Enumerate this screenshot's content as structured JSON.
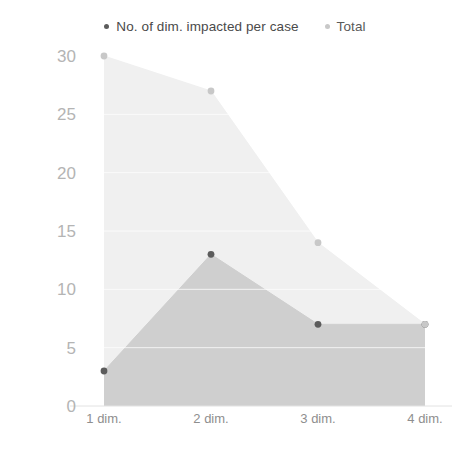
{
  "chart_data": {
    "type": "area",
    "title": "",
    "subtitle": "",
    "xlabel": "",
    "ylabel": "",
    "categories": [
      "1 dim.",
      "2 dim.",
      "3 dim.",
      "4 dim."
    ],
    "series": [
      {
        "name": "No. of dim. impacted per case",
        "values": [
          3,
          13,
          7,
          7
        ],
        "color": "#5c5c5c",
        "fill": "#cfcfcf"
      },
      {
        "name": "Total",
        "values": [
          30,
          27,
          14,
          7
        ],
        "color": "#c8c8c8",
        "fill": "#f0f0f0"
      }
    ],
    "ylim": [
      0,
      30
    ],
    "yticks": [
      0,
      5,
      10,
      15,
      20,
      25,
      30
    ],
    "ytick_labels": [
      "0",
      "5",
      "10",
      "15",
      "20",
      "25",
      "30"
    ],
    "grid": true,
    "grid_color": "#ffffff",
    "legend_position": "top"
  },
  "legend": {
    "items": [
      {
        "label": "No. of dim. impacted per case"
      },
      {
        "label": "Total"
      }
    ]
  },
  "axes": {
    "y": {
      "labels": [
        "30",
        "25",
        "20",
        "15",
        "10",
        "5",
        "0"
      ]
    },
    "x": {
      "labels": [
        "1 dim.",
        "2 dim.",
        "3 dim.",
        "4 dim."
      ]
    }
  }
}
